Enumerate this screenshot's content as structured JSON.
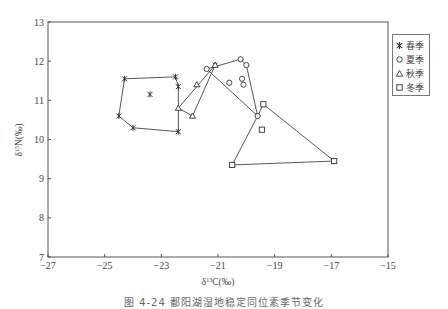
{
  "chart_data": {
    "type": "scatter",
    "title": "",
    "xlabel": "δ13C(‰)",
    "ylabel": "δ15N(‰)",
    "xlim": [
      -27,
      -15
    ],
    "ylim": [
      7,
      13
    ],
    "xticks": [
      -27,
      -25,
      -23,
      -21,
      -19,
      -17,
      -15
    ],
    "yticks": [
      7,
      8,
      9,
      10,
      11,
      12,
      13
    ],
    "grid": false,
    "legend_position": "right-outside",
    "series": [
      {
        "name": "春季",
        "marker": "asterisk",
        "points": [
          [
            -24.3,
            11.55
          ],
          [
            -22.5,
            11.6
          ],
          [
            -22.4,
            11.35
          ],
          [
            -22.4,
            10.2
          ],
          [
            -24.0,
            10.3
          ],
          [
            -24.5,
            10.6
          ],
          [
            -23.4,
            11.15
          ],
          [
            -21.1,
            11.9
          ]
        ],
        "hull": [
          [
            -24.3,
            11.55
          ],
          [
            -22.5,
            11.6
          ],
          [
            -22.4,
            11.35
          ],
          [
            -22.4,
            10.2
          ],
          [
            -24.0,
            10.3
          ],
          [
            -24.5,
            10.6
          ]
        ]
      },
      {
        "name": "夏季",
        "marker": "circle",
        "points": [
          [
            -21.4,
            11.8
          ],
          [
            -20.2,
            12.05
          ],
          [
            -20.0,
            11.9
          ],
          [
            -20.6,
            11.45
          ],
          [
            -20.15,
            11.55
          ],
          [
            -20.1,
            11.4
          ],
          [
            -19.6,
            10.6
          ]
        ],
        "hull": [
          [
            -21.4,
            11.8
          ],
          [
            -20.2,
            12.05
          ],
          [
            -20.0,
            11.9
          ],
          [
            -19.6,
            10.6
          ]
        ]
      },
      {
        "name": "秋季",
        "marker": "triangle",
        "points": [
          [
            -22.4,
            10.8
          ],
          [
            -21.75,
            11.4
          ],
          [
            -21.9,
            10.6
          ],
          [
            -21.1,
            11.9
          ]
        ],
        "hull": [
          [
            -22.4,
            10.8
          ],
          [
            -21.1,
            11.9
          ],
          [
            -21.9,
            10.6
          ]
        ]
      },
      {
        "name": "冬季",
        "marker": "square",
        "points": [
          [
            -19.4,
            10.9
          ],
          [
            -19.45,
            10.25
          ],
          [
            -20.5,
            9.35
          ],
          [
            -16.9,
            9.45
          ]
        ],
        "hull": [
          [
            -19.4,
            10.9
          ],
          [
            -16.9,
            9.45
          ],
          [
            -20.5,
            9.35
          ],
          [
            -19.6,
            10.6
          ]
        ]
      }
    ]
  },
  "legend": {
    "items": [
      {
        "label": "春季",
        "marker": "asterisk"
      },
      {
        "label": "夏季",
        "marker": "circle"
      },
      {
        "label": "秋季",
        "marker": "triangle"
      },
      {
        "label": "冬季",
        "marker": "square"
      }
    ]
  },
  "caption": "图 4-24  鄱阳湖湿地稳定同位素季节变化"
}
